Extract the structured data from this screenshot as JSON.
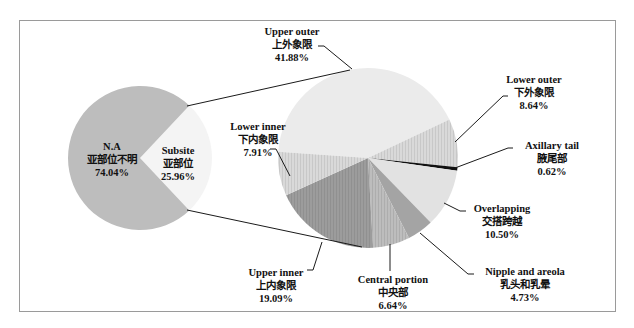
{
  "chart_data": [
    {
      "type": "pie",
      "title": "",
      "role": "overview",
      "categories": [
        "N.A 亚部位不明",
        "Subsite 亚部位"
      ],
      "values": [
        74.04,
        25.96
      ],
      "slices": [
        {
          "key": "na",
          "label_en": "N.A",
          "label_cn": "亚部位不明",
          "value": 74.04,
          "display": "74.04%",
          "color": "#bdbdbd"
        },
        {
          "key": "subsite",
          "label_en": "Subsite",
          "label_cn": "亚部位",
          "value": 25.96,
          "display": "25.96%",
          "color": "#f4f4f4"
        }
      ]
    },
    {
      "type": "pie",
      "title": "",
      "role": "subsite breakdown",
      "categories": [
        "Upper outer 上外象限",
        "Lower outer 下外象限",
        "Axillary tail 腋尾部",
        "Overlapping 交搭跨越",
        "Nipple and areola 乳头和乳晕",
        "Central portion 中央部",
        "Upper inner 上内象限",
        "Lower inner 下内象限"
      ],
      "values": [
        41.88,
        8.64,
        0.62,
        10.5,
        4.73,
        6.64,
        19.09,
        7.91
      ],
      "slices": [
        {
          "key": "upper_outer",
          "label_en": "Upper outer",
          "label_cn": "上外象限",
          "value": 41.88,
          "display": "41.88%",
          "color": "#ebebeb"
        },
        {
          "key": "lower_outer",
          "label_en": "Lower outer",
          "label_cn": "下外象限",
          "value": 8.64,
          "display": "8.64%",
          "color": "#d6d6d6"
        },
        {
          "key": "axillary_tail",
          "label_en": "Axillary tail",
          "label_cn": "腋尾部",
          "value": 0.62,
          "display": "0.62%",
          "color": "#111111"
        },
        {
          "key": "overlapping",
          "label_en": "Overlapping",
          "label_cn": "交搭跨越",
          "value": 10.5,
          "display": "10.50%",
          "color": "#e2e2e2"
        },
        {
          "key": "nipple_areola",
          "label_en": "Nipple and areola",
          "label_cn": "乳头和乳晕",
          "value": 4.73,
          "display": "4.73%",
          "color": "#a4a4a4"
        },
        {
          "key": "central_portion",
          "label_en": "Central portion",
          "label_cn": "中央部",
          "value": 6.64,
          "display": "6.64%",
          "color": "#bcbcbc"
        },
        {
          "key": "upper_inner",
          "label_en": "Upper inner",
          "label_cn": "上内象限",
          "value": 19.09,
          "display": "19.09%",
          "color": "#9a9a9a"
        },
        {
          "key": "lower_inner",
          "label_en": "Lower inner",
          "label_cn": "下内象限",
          "value": 7.91,
          "display": "7.91%",
          "color": "#cfcfcf"
        }
      ]
    }
  ],
  "labels": {
    "na": {
      "en": "N.A",
      "cn": "亚部位不明",
      "pct": "74.04%"
    },
    "subsite": {
      "en": "Subsite",
      "cn": "亚部位",
      "pct": "25.96%"
    },
    "upper_outer": {
      "en": "Upper outer",
      "cn": "上外象限",
      "pct": "41.88%"
    },
    "lower_outer": {
      "en": "Lower outer",
      "cn": "下外象限",
      "pct": "8.64%"
    },
    "axillary_tail": {
      "en": "Axillary tail",
      "cn": "腋尾部",
      "pct": "0.62%"
    },
    "overlapping": {
      "en": "Overlapping",
      "cn": "交搭跨越",
      "pct": "10.50%"
    },
    "nipple_areola": {
      "en": "Nipple and areola",
      "cn": "乳头和乳晕",
      "pct": "4.73%"
    },
    "central_portion": {
      "en": "Central portion",
      "cn": "中央部",
      "pct": "6.64%"
    },
    "upper_inner": {
      "en": "Upper inner",
      "cn": "上内象限",
      "pct": "19.09%"
    },
    "lower_inner": {
      "en": "Lower inner",
      "cn": "下内象限",
      "pct": "7.91%"
    }
  }
}
